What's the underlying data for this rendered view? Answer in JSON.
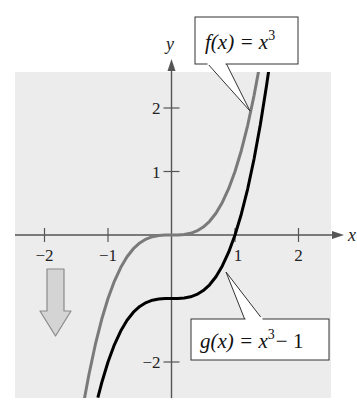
{
  "chart_data": {
    "type": "line",
    "title": "",
    "xlabel": "x",
    "ylabel": "y",
    "xlim": [
      -2.5,
      2.5
    ],
    "ylim": [
      -2.57,
      2.57
    ],
    "grid": false,
    "x_ticks": [
      -2,
      -1,
      1,
      2
    ],
    "x_tick_labels": [
      "−2",
      "−1",
      "1",
      "2"
    ],
    "y_ticks": [
      2,
      1,
      -2
    ],
    "y_tick_labels": [
      "2",
      "1",
      "−2"
    ],
    "series": [
      {
        "name": "f(x) = x^3",
        "label_main": "f(x) = x",
        "label_sup": "3",
        "label_tail": "",
        "color": "#7a7a7a",
        "x": [
          -1.37,
          -1.3,
          -1.2,
          -1.1,
          -1.0,
          -0.9,
          -0.8,
          -0.7,
          -0.6,
          -0.5,
          -0.4,
          -0.3,
          -0.2,
          -0.1,
          0.0,
          0.1,
          0.2,
          0.3,
          0.4,
          0.5,
          0.6,
          0.7,
          0.8,
          0.9,
          1.0,
          1.1,
          1.2,
          1.3,
          1.37
        ],
        "y": [
          -2.571,
          -2.197,
          -1.728,
          -1.331,
          -1.0,
          -0.729,
          -0.512,
          -0.343,
          -0.216,
          -0.125,
          -0.064,
          -0.027,
          -0.008,
          -0.001,
          0.0,
          0.001,
          0.008,
          0.027,
          0.064,
          0.125,
          0.216,
          0.343,
          0.512,
          0.729,
          1.0,
          1.331,
          1.728,
          2.197,
          2.571
        ]
      },
      {
        "name": "g(x) = x^3 - 1",
        "label_main": "g(x) = x",
        "label_sup": "3",
        "label_tail": "− 1",
        "color": "#000000",
        "x": [
          -1.16,
          -1.1,
          -1.0,
          -0.9,
          -0.8,
          -0.7,
          -0.6,
          -0.5,
          -0.4,
          -0.3,
          -0.2,
          -0.1,
          0.0,
          0.1,
          0.2,
          0.3,
          0.4,
          0.5,
          0.6,
          0.7,
          0.8,
          0.9,
          1.0,
          1.1,
          1.2,
          1.3,
          1.4,
          1.5,
          1.53
        ],
        "y": [
          -2.561,
          -2.331,
          -2.0,
          -1.729,
          -1.512,
          -1.343,
          -1.216,
          -1.125,
          -1.064,
          -1.027,
          -1.008,
          -1.001,
          -1.0,
          -0.999,
          -0.992,
          -0.973,
          -0.936,
          -0.875,
          -0.784,
          -0.657,
          -0.488,
          -0.271,
          0.0,
          0.331,
          0.728,
          1.197,
          1.744,
          2.375,
          2.582
        ]
      }
    ],
    "annotations": [
      {
        "type": "callout",
        "text": "f(x) = x^3",
        "points_to_series": "f(x) = x^3"
      },
      {
        "type": "callout",
        "text": "g(x) = x^3 − 1",
        "points_to_series": "g(x) = x^3 - 1"
      },
      {
        "type": "arrow",
        "direction": "down",
        "meaning": "vertical shift down 1 unit"
      }
    ]
  },
  "axes": {
    "x_name": "x",
    "y_name": "y"
  },
  "callouts": {
    "f": {
      "main": "f(x) = x",
      "sup": "3",
      "tail": ""
    },
    "g": {
      "main": "g(x) = x",
      "sup": "3",
      "tail": "− 1"
    }
  },
  "colors": {
    "plot_background": "#ececec",
    "axis": "#555555",
    "f_curve": "#7a7a7a",
    "g_curve": "#000000",
    "shift_arrow_fill": "#d4d4d4",
    "shift_arrow_stroke": "#8a8a8a"
  }
}
